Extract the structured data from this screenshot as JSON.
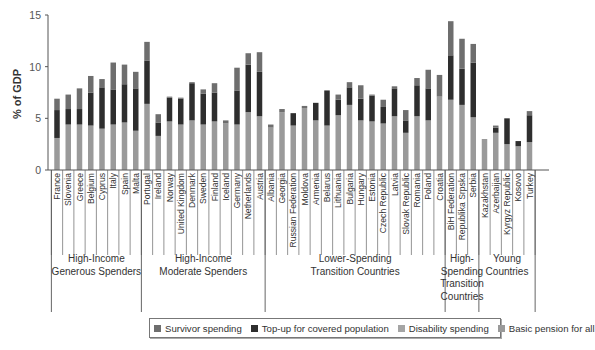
{
  "chart_data": {
    "type": "bar",
    "stacked": true,
    "title": "",
    "xlabel": "",
    "ylabel": "% of GDP",
    "ylim": [
      0,
      15
    ],
    "yticks": [
      0,
      5,
      10,
      15
    ],
    "grid": false,
    "legend_position": "bottom",
    "categories": [
      "France",
      "Slovenia",
      "Greece",
      "Belgium",
      "Cyprus",
      "Italy",
      "Spain",
      "Malta",
      "Portugal",
      "Ireland",
      "Norway",
      "United Kingdom",
      "Denmark",
      "Sweden",
      "Finland",
      "Iceland",
      "Germany",
      "Netherlands",
      "Austria",
      "Albania",
      "Georgia",
      "Russian Federation",
      "Moldova",
      "Armenia",
      "Belarus",
      "Lithuania",
      "Bulgaria",
      "Hungary",
      "Estonia",
      "Czech Republic",
      "Latvia",
      "Slovak Republic",
      "Romania",
      "Poland",
      "Croatia",
      "BiH Federation",
      "Republika Srpska",
      "Serbia",
      "Kazakhstan",
      "Azerbaijan",
      "Kyrgyz Republic",
      "Kosovo",
      "Turkey"
    ],
    "series": [
      {
        "name": "Basic pension for all",
        "color": "#9a9a9a",
        "values": [
          3.1,
          4.4,
          4.4,
          4.3,
          4.0,
          4.4,
          4.6,
          3.8,
          6.4,
          3.3,
          4.7,
          4.4,
          4.8,
          4.4,
          4.7,
          4.5,
          4.4,
          5.6,
          5.2,
          4.1,
          5.6,
          4.3,
          6.0,
          4.8,
          4.3,
          5.3,
          6.3,
          4.8,
          4.7,
          4.5,
          5.2,
          3.6,
          5.2,
          4.8,
          7.1,
          6.8,
          6.3,
          5.1,
          3.0,
          3.6,
          2.5,
          2.3,
          2.7
        ]
      },
      {
        "name": "Disability spending",
        "color": "#a5a5a5",
        "values": [
          0,
          0,
          0,
          0,
          0,
          0,
          0,
          0,
          0,
          0,
          0,
          0,
          0,
          0,
          0,
          0,
          0,
          0,
          0,
          0,
          0,
          0,
          0,
          0,
          0,
          0,
          0,
          0,
          0,
          0,
          0,
          0,
          0,
          0,
          0,
          0,
          0,
          0,
          0,
          0,
          0,
          0,
          0
        ]
      },
      {
        "name": "Top-up for covered population",
        "color": "#2e2e2e",
        "values": [
          2.7,
          1.5,
          1.5,
          3.2,
          4.0,
          3.4,
          3.7,
          4.1,
          4.2,
          1.3,
          2.3,
          2.5,
          3.6,
          3.0,
          2.8,
          0,
          3.3,
          4.6,
          4.3,
          0,
          0,
          1.2,
          0,
          1.7,
          3.4,
          1.5,
          1.7,
          2.1,
          2.5,
          1.6,
          2.7,
          1.2,
          3.0,
          3.1,
          0,
          4.3,
          3.5,
          5.3,
          0,
          0.5,
          2.5,
          0.5,
          2.6
        ]
      },
      {
        "name": "Survivor spending",
        "color": "#6e6e6e",
        "values": [
          1.1,
          1.4,
          2.0,
          1.6,
          0.8,
          2.6,
          1.9,
          1.6,
          1.8,
          0.8,
          0.1,
          0.1,
          0.1,
          0.4,
          0.9,
          0.3,
          2.2,
          1.1,
          1.9,
          0.3,
          0.3,
          0,
          0.2,
          0,
          0,
          0.5,
          0.5,
          1.3,
          0.1,
          0.7,
          0.2,
          1.0,
          0.7,
          1.8,
          2.1,
          3.3,
          2.9,
          1.8,
          0,
          0.2,
          0,
          0,
          0.4
        ]
      }
    ],
    "totals": [
      6.9,
      7.3,
      7.9,
      9.1,
      8.8,
      10.4,
      10.2,
      9.5,
      12.4,
      5.4,
      7.1,
      7.0,
      8.5,
      7.8,
      8.4,
      4.8,
      9.9,
      11.3,
      11.4,
      4.4,
      5.9,
      5.5,
      6.2,
      6.5,
      7.7,
      7.3,
      8.5,
      8.2,
      7.3,
      6.8,
      8.1,
      5.8,
      8.9,
      9.7,
      9.2,
      14.4,
      12.7,
      12.2,
      3.0,
      4.3,
      5.0,
      2.8,
      5.7
    ],
    "groups": [
      {
        "label": [
          "High-Income",
          "Generous Spenders"
        ],
        "members": [
          "France",
          "Slovenia",
          "Greece",
          "Belgium",
          "Cyprus",
          "Italy",
          "Spain",
          "Malta"
        ]
      },
      {
        "label": [
          "High-Income",
          "Moderate Spenders"
        ],
        "members": [
          "Portugal",
          "Ireland",
          "Norway",
          "United Kingdom",
          "Denmark",
          "Sweden",
          "Finland",
          "Iceland",
          "Germany",
          "Netherlands",
          "Austria"
        ]
      },
      {
        "label": [
          "Lower-Spending",
          "Transition Countries"
        ],
        "members": [
          "Albania",
          "Georgia",
          "Russian Federation",
          "Moldova",
          "Armenia",
          "Belarus",
          "Lithuania",
          "Bulgaria",
          "Hungary",
          "Estonia",
          "Czech Republic",
          "Latvia",
          "Slovak Republic",
          "Romania",
          "Poland",
          "Croatia"
        ]
      },
      {
        "label": [
          "High-",
          "Spending",
          "Transition",
          "Countries"
        ],
        "members": [
          "BiH Federation",
          "Republika Srpska",
          "Serbia"
        ]
      },
      {
        "label": [
          "Young",
          "Countries"
        ],
        "members": [
          "Kazakhstan",
          "Azerbaijan",
          "Kyrgyz Republic",
          "Kosovo",
          "Turkey"
        ]
      }
    ]
  },
  "legend": {
    "items": [
      {
        "label": "Survivor spending",
        "color": "#6e6e6e"
      },
      {
        "label": "Top-up for covered population",
        "color": "#2e2e2e"
      },
      {
        "label": "Disability spending",
        "color": "#a5a5a5"
      },
      {
        "label": "Basic pension for all",
        "color": "#9a9a9a"
      }
    ]
  },
  "axis": {
    "ylabel": "% of GDP",
    "yticks": [
      "0",
      "5",
      "10",
      "15"
    ]
  }
}
